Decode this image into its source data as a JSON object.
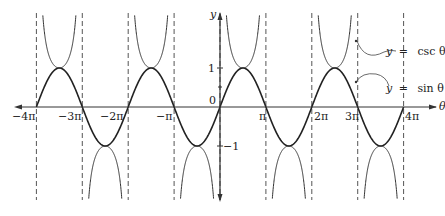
{
  "chart_data": {
    "type": "line",
    "title": "",
    "xlabel": "θ",
    "ylabel": "y",
    "xlim": [
      -12.566,
      12.566
    ],
    "ylim": [
      -2.4,
      2.4
    ],
    "grid": false,
    "x_ticks": [
      {
        "value": -12.566,
        "label": "−4π"
      },
      {
        "value": -9.425,
        "label": "−3π"
      },
      {
        "value": -6.283,
        "label": "−2π"
      },
      {
        "value": -3.1416,
        "label": "−π"
      },
      {
        "value": 0,
        "label": "0"
      },
      {
        "value": 3.1416,
        "label": "π"
      },
      {
        "value": 6.283,
        "label": "2π"
      },
      {
        "value": 9.425,
        "label": "3π"
      },
      {
        "value": 12.566,
        "label": "4π"
      }
    ],
    "y_ticks": [
      {
        "value": 1,
        "label": "1"
      },
      {
        "value": -1,
        "label": "−1"
      }
    ],
    "asymptotes": [
      -12.566,
      -9.425,
      -6.283,
      -3.1416,
      0,
      3.1416,
      6.283,
      9.425,
      12.566
    ],
    "series": [
      {
        "name": "y = csc θ",
        "function": "csc",
        "style": "thin"
      },
      {
        "name": "y = sin θ",
        "function": "sin",
        "style": "bold"
      }
    ],
    "annotations": [
      {
        "text": "y = csc θ",
        "points_to": "csc curve near θ≈3π"
      },
      {
        "text": "y = sin θ",
        "points_to": "sin curve near θ≈3π"
      }
    ],
    "legend_position": "right (inline labels)"
  },
  "labels": {
    "x_axis": "θ",
    "y_axis": "y",
    "origin": "0",
    "csc_label_y": "y",
    "csc_label_eq": "=",
    "csc_label_fn": "csc θ",
    "sin_label_y": "y",
    "sin_label_eq": "=",
    "sin_label_fn": "sin θ",
    "tick_neg4pi": "−4π",
    "tick_neg3pi": "−3π",
    "tick_neg2pi": "−2π",
    "tick_negpi": "−π",
    "tick_pi": "π",
    "tick_2pi": "2π",
    "tick_3pi": "3π",
    "tick_4pi": "4π",
    "tick_y1": "1",
    "tick_yneg1": "−1"
  }
}
